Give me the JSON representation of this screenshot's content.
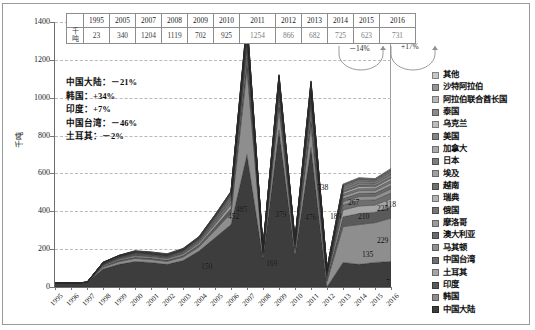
{
  "chart_data": {
    "type": "area",
    "title": "",
    "xlabel": "",
    "ylabel": "千吨",
    "ylim": [
      0,
      1400
    ],
    "ytick_labels": [
      "0",
      "200",
      "400",
      "600",
      "800",
      "1000",
      "1200",
      "1400"
    ],
    "yticks": [
      0,
      200,
      400,
      600,
      800,
      1000,
      1200,
      1400
    ],
    "grid": true,
    "legend_position": "right",
    "stacked": true,
    "x": [
      "1995",
      "1996",
      "1997",
      "1998",
      "1999",
      "2000",
      "2001",
      "2002",
      "2003",
      "2004",
      "2005",
      "2006",
      "2007",
      "2008",
      "2009",
      "2010",
      "2011",
      "2012",
      "2013",
      "2014",
      "2015",
      "2016"
    ],
    "series": [
      {
        "name": "中国大陆",
        "color": "#3d3d3d",
        "values": [
          23,
          20,
          25,
          95,
          120,
          135,
          130,
          120,
          140,
          190,
          260,
          330,
          700,
          150,
          830,
          169,
          738,
          0,
          130,
          120,
          130,
          135
        ]
      },
      {
        "name": "韩国",
        "color": "#8e8e8e",
        "values": [
          0,
          0,
          0,
          10,
          14,
          16,
          15,
          15,
          18,
          22,
          40,
          60,
          452,
          16,
          118,
          25,
          118,
          30,
          189,
          210,
          210,
          229
        ]
      },
      {
        "name": "印度",
        "color": "#5a5a5a",
        "values": [
          0,
          0,
          0,
          5,
          7,
          8,
          8,
          8,
          9,
          11,
          18,
          26,
          60,
          10,
          40,
          12,
          55,
          14,
          52,
          58,
          55,
          60
        ]
      },
      {
        "name": "土耳其",
        "color": "#a5a5a5",
        "values": [
          0,
          0,
          0,
          4,
          5,
          6,
          6,
          6,
          7,
          8,
          12,
          18,
          40,
          7,
          28,
          9,
          38,
          10,
          36,
          40,
          38,
          42
        ]
      },
      {
        "name": "中国台湾",
        "color": "#6f6f6f",
        "values": [
          0,
          0,
          0,
          3,
          4,
          5,
          5,
          5,
          5,
          6,
          9,
          13,
          30,
          5,
          20,
          7,
          28,
          8,
          26,
          29,
          27,
          30
        ]
      },
      {
        "name": "马其顿",
        "color": "#909090",
        "values": [
          0,
          0,
          0,
          2,
          3,
          3,
          3,
          3,
          4,
          5,
          7,
          10,
          22,
          4,
          15,
          5,
          20,
          6,
          19,
          21,
          20,
          22
        ]
      },
      {
        "name": "澳大利亚",
        "color": "#6b6b6b",
        "values": [
          0,
          0,
          0,
          2,
          2,
          3,
          3,
          3,
          3,
          4,
          6,
          8,
          18,
          3,
          12,
          4,
          16,
          5,
          15,
          17,
          16,
          18
        ]
      },
      {
        "name": "摩洛哥",
        "color": "#9c9c9c",
        "values": [
          0,
          0,
          0,
          2,
          2,
          2,
          2,
          2,
          3,
          3,
          5,
          7,
          15,
          3,
          10,
          4,
          13,
          4,
          13,
          14,
          13,
          15
        ]
      },
      {
        "name": "俄国",
        "color": "#777777",
        "values": [
          0,
          0,
          0,
          1,
          2,
          2,
          2,
          2,
          2,
          3,
          4,
          6,
          13,
          2,
          9,
          3,
          11,
          4,
          11,
          12,
          11,
          13
        ]
      },
      {
        "name": "瑞典",
        "color": "#b2b2b2",
        "values": [
          0,
          0,
          0,
          1,
          1,
          2,
          2,
          2,
          2,
          2,
          4,
          5,
          11,
          2,
          7,
          3,
          9,
          3,
          9,
          10,
          9,
          11
        ]
      },
      {
        "name": "越南",
        "color": "#707070",
        "values": [
          0,
          0,
          0,
          1,
          1,
          1,
          1,
          1,
          2,
          2,
          3,
          4,
          9,
          2,
          6,
          2,
          8,
          3,
          8,
          8,
          8,
          9
        ]
      },
      {
        "name": "埃及",
        "color": "#a0a0a0",
        "values": [
          0,
          0,
          0,
          1,
          1,
          1,
          1,
          1,
          1,
          2,
          3,
          4,
          8,
          1,
          5,
          2,
          7,
          2,
          7,
          7,
          7,
          8
        ]
      },
      {
        "name": "日本",
        "color": "#7d7d7d",
        "values": [
          0,
          0,
          0,
          1,
          1,
          1,
          1,
          1,
          1,
          2,
          2,
          3,
          7,
          1,
          5,
          2,
          6,
          2,
          6,
          6,
          6,
          7
        ]
      },
      {
        "name": "加拿大",
        "color": "#a9a9a9",
        "values": [
          0,
          0,
          0,
          1,
          1,
          1,
          1,
          1,
          1,
          1,
          2,
          3,
          6,
          1,
          4,
          1,
          5,
          2,
          5,
          6,
          5,
          6
        ]
      },
      {
        "name": "美国",
        "color": "#848484",
        "values": [
          0,
          0,
          0,
          1,
          1,
          1,
          1,
          1,
          1,
          1,
          2,
          2,
          5,
          1,
          3,
          1,
          4,
          1,
          4,
          5,
          4,
          5
        ]
      },
      {
        "name": "乌克兰",
        "color": "#bcbcbc",
        "values": [
          0,
          0,
          0,
          0,
          1,
          1,
          1,
          1,
          1,
          1,
          1,
          2,
          4,
          1,
          3,
          1,
          4,
          1,
          4,
          4,
          4,
          4
        ]
      },
      {
        "name": "泰国",
        "color": "#8b8b8b",
        "values": [
          0,
          0,
          0,
          0,
          1,
          1,
          1,
          1,
          1,
          1,
          1,
          2,
          4,
          1,
          2,
          1,
          3,
          1,
          3,
          3,
          3,
          4
        ]
      },
      {
        "name": "阿拉伯联合酋长国",
        "color": "#b6b6b6",
        "values": [
          0,
          0,
          0,
          0,
          0,
          1,
          1,
          1,
          1,
          1,
          1,
          1,
          3,
          1,
          2,
          1,
          3,
          1,
          3,
          3,
          3,
          3
        ]
      },
      {
        "name": "沙特阿拉伯",
        "color": "#949494",
        "values": [
          0,
          0,
          0,
          0,
          0,
          1,
          1,
          1,
          1,
          1,
          1,
          1,
          3,
          1,
          2,
          1,
          2,
          1,
          2,
          3,
          2,
          3
        ]
      },
      {
        "name": "其他",
        "color": "#c6c6c6",
        "values": [
          0,
          0,
          0,
          0,
          0,
          1,
          1,
          1,
          1,
          1,
          1,
          1,
          2,
          1,
          2,
          1,
          2,
          1,
          2,
          2,
          2,
          3
        ]
      }
    ],
    "point_labels": [
      {
        "text": "150",
        "x": 2006,
        "value": 150
      },
      {
        "text": "485",
        "x": 2007,
        "value": 485
      },
      {
        "text": "452",
        "x": 2007,
        "value": 452
      },
      {
        "text": "379",
        "x": 2009,
        "value": 379
      },
      {
        "text": "169",
        "x": 2009,
        "value": 169
      },
      {
        "text": "738",
        "x": 2011,
        "value": 738
      },
      {
        "text": "476",
        "x": 2012,
        "value": 476
      },
      {
        "text": "118",
        "x": 2011,
        "value": 118
      },
      {
        "text": "189",
        "x": 2013,
        "value": 189
      },
      {
        "text": "267",
        "x": 2014,
        "value": 267
      },
      {
        "text": "210",
        "x": 2014,
        "value": 210
      },
      {
        "text": "225",
        "x": 2016,
        "value": 225
      },
      {
        "text": "229",
        "x": 2016,
        "value": 229
      },
      {
        "text": "135",
        "x": 2015,
        "value": 135
      },
      {
        "text": "7",
        "x": 2016,
        "value": 7
      }
    ],
    "annotations": [
      {
        "label": "中国大陆",
        "value": "－21%"
      },
      {
        "label": "韩国",
        "value": "+34%"
      },
      {
        "label": "印度",
        "value": "+7%"
      },
      {
        "label": "中国台湾",
        "value": "－46%"
      },
      {
        "label": "土耳其",
        "value": "－2%"
      }
    ],
    "callout_arrows": [
      {
        "text": "－14%"
      },
      {
        "text": "+17%"
      }
    ]
  },
  "table": {
    "row_label": "千吨",
    "years": [
      "1995",
      "2005",
      "2007",
      "2008",
      "2009",
      "2010",
      "2011",
      "2012",
      "2013",
      "2014",
      "2015",
      "2016"
    ],
    "values": [
      "23",
      "340",
      "1204",
      "1119",
      "702",
      "925",
      "1254",
      "866",
      "682",
      "725",
      "623",
      "731"
    ],
    "dim_from_index": 6
  },
  "legend": {
    "items": [
      {
        "label": "其他",
        "color": "#c6c6c6"
      },
      {
        "label": "沙特阿拉伯",
        "color": "#949494"
      },
      {
        "label": "阿拉伯联合酋长国",
        "color": "#b6b6b6"
      },
      {
        "label": "泰国",
        "color": "#8b8b8b"
      },
      {
        "label": "乌克兰",
        "color": "#bcbcbc"
      },
      {
        "label": "美国",
        "color": "#848484"
      },
      {
        "label": "加拿大",
        "color": "#a9a9a9"
      },
      {
        "label": "日本",
        "color": "#7d7d7d"
      },
      {
        "label": "埃及",
        "color": "#a0a0a0"
      },
      {
        "label": "越南",
        "color": "#707070"
      },
      {
        "label": "瑞典",
        "color": "#b2b2b2"
      },
      {
        "label": "俄国",
        "color": "#777777"
      },
      {
        "label": "摩洛哥",
        "color": "#9c9c9c"
      },
      {
        "label": "澳大利亚",
        "color": "#6b6b6b"
      },
      {
        "label": "马其顿",
        "color": "#909090"
      },
      {
        "label": "中国台湾",
        "color": "#6f6f6f"
      },
      {
        "label": "土耳其",
        "color": "#a5a5a5"
      },
      {
        "label": "印度",
        "color": "#5a5a5a"
      },
      {
        "label": "韩国",
        "color": "#8e8e8e"
      },
      {
        "label": "中国大陆",
        "color": "#3d3d3d"
      }
    ]
  }
}
